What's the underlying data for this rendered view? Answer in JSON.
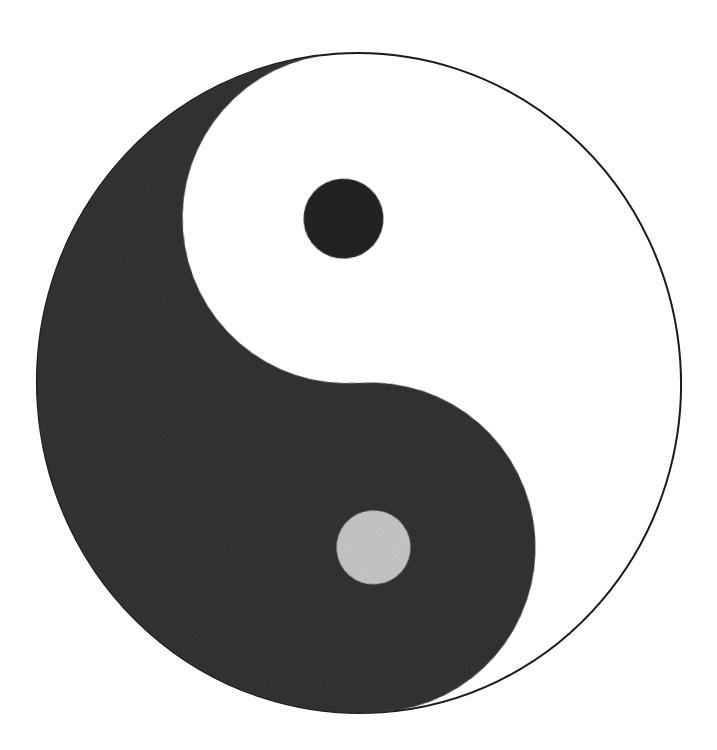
{
  "image": {
    "title": "Yin Yang symbol (Taijitu)",
    "subject": "taijitu",
    "alt_text": "Black and white yin yang symbol",
    "background_color": "#ffffff",
    "ink_color": "#222222",
    "ink_color_secondary": "#2b2b2b",
    "outline_color": "#1a1a1a",
    "width": 717,
    "height": 750,
    "medium": "flat two-tone ink drawing on white ground"
  },
  "geometry": {
    "outer_circle": {
      "label": "outer circle",
      "center_x": 359,
      "center_y": 383,
      "radius_x": 322,
      "radius_y": 330,
      "stroke_width": 2,
      "rotation_degrees": -4
    },
    "yin_half": {
      "label": "yin (dark) half",
      "fill": "#222222",
      "side": "left"
    },
    "yang_half": {
      "label": "yang (light) half",
      "fill": "#ffffff",
      "side": "right"
    },
    "upper_lobe": {
      "label": "upper lobe",
      "center_x": 359,
      "center_y": 218,
      "radius": 165,
      "fill": "#ffffff"
    },
    "lower_lobe": {
      "label": "lower lobe",
      "center_x": 359,
      "center_y": 548,
      "radius": 165,
      "fill": "#222222"
    },
    "dark_dot": {
      "label": "dark eye dot in light lobe",
      "center_x": 355,
      "center_y": 218,
      "radius": 40,
      "fill": "#222222"
    },
    "light_dot": {
      "label": "light eye dot in dark lobe",
      "center_x": 362,
      "center_y": 548,
      "radius": 37,
      "fill": "#ffffff"
    }
  },
  "paths": {
    "yin_body": "M 359 53 A 165 165 0 0 0 359 383 A 165 165 0 0 1 359 713 A 322 330 0 0 1 359 53 Z",
    "outer_ring": "M 359 53 A 322 330 0 1 1 358.9 53 Z"
  }
}
